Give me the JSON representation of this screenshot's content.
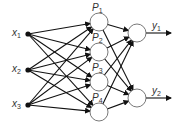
{
  "diagram": {
    "type": "neural-network",
    "inputs": [
      {
        "id": "x1",
        "label": "x",
        "sub": "1",
        "x": 28,
        "y": 34
      },
      {
        "id": "x2",
        "label": "x",
        "sub": "2",
        "x": 28,
        "y": 70
      },
      {
        "id": "x3",
        "label": "x",
        "sub": "3",
        "x": 28,
        "y": 105
      }
    ],
    "hidden": [
      {
        "id": "P1",
        "label": "P",
        "sub": "1",
        "x": 99,
        "y": 22
      },
      {
        "id": "P2",
        "label": "P",
        "sub": "2",
        "x": 99,
        "y": 52
      },
      {
        "id": "P3",
        "label": "P",
        "sub": "3",
        "x": 99,
        "y": 82
      },
      {
        "id": "P4",
        "label": "P",
        "sub": "4",
        "x": 99,
        "y": 112
      }
    ],
    "outputs": [
      {
        "id": "y1",
        "label": "y",
        "sub": "1",
        "x": 137,
        "y": 33
      },
      {
        "id": "y2",
        "label": "y",
        "sub": "2",
        "x": 137,
        "y": 98
      }
    ]
  }
}
